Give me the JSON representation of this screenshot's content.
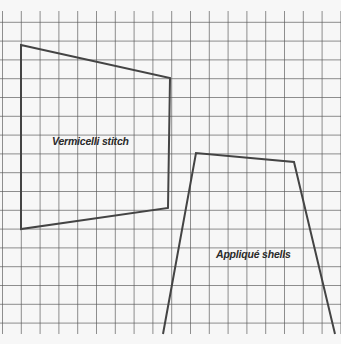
{
  "diagram": {
    "background": "#f7f7f7",
    "grid": {
      "color": "#5a5a5a",
      "spacing": 18.8,
      "x_start": 2.5,
      "y_start": 3.5,
      "top_blank": 11
    },
    "shapes": [
      {
        "name": "vermicelli-stitch",
        "label": "Vermicelli stitch",
        "points": [
          [
            21,
            45
          ],
          [
            170,
            78
          ],
          [
            168,
            208
          ],
          [
            21,
            229
          ]
        ],
        "label_pos": [
          52,
          135
        ]
      },
      {
        "name": "applique-shells",
        "label": "Appliqué shells",
        "points": [
          [
            163,
            334
          ],
          [
            196,
            153
          ],
          [
            294,
            162
          ],
          [
            335,
            334
          ]
        ],
        "open_bottom": true,
        "label_pos": [
          216,
          248
        ]
      }
    ],
    "stroke_color": "#444444"
  }
}
